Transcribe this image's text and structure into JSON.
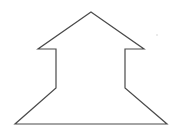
{
  "canvas": {
    "width": 178,
    "height": 140,
    "background": "#ffffff"
  },
  "shape": {
    "name": "house-arrow-outline",
    "stroke": "#4a4a4a",
    "stroke_width": 1.2,
    "fill": "none",
    "points": [
      [
        91,
        12
      ],
      [
        144,
        49
      ],
      [
        125,
        49
      ],
      [
        125,
        88
      ],
      [
        167,
        124
      ],
      [
        15,
        124
      ],
      [
        56,
        88
      ],
      [
        56,
        49
      ],
      [
        38,
        49
      ]
    ]
  },
  "noise_dot": {
    "x": 157,
    "y": 35,
    "r": 0.7,
    "color": "#c8c8c8"
  }
}
